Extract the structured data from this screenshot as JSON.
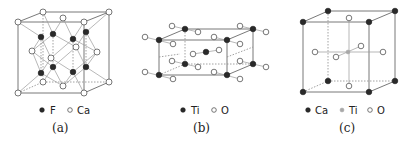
{
  "panels": [
    {
      "id": "a",
      "caption": "(a)",
      "structure": "fluorite",
      "legend": [
        {
          "symbol": "filled-circle",
          "label": "F"
        },
        {
          "symbol": "open-circle",
          "label": "Ca"
        }
      ]
    },
    {
      "id": "b",
      "caption": "(b)",
      "structure": "rutile",
      "legend": [
        {
          "symbol": "filled-circle",
          "label": "Ti"
        },
        {
          "symbol": "open-circle",
          "label": "O"
        }
      ]
    },
    {
      "id": "c",
      "caption": "(c)",
      "structure": "perovskite",
      "legend": [
        {
          "symbol": "filled-circle",
          "label": "Ca"
        },
        {
          "symbol": "gray-circle",
          "label": "Ti"
        },
        {
          "symbol": "open-circle",
          "label": "O"
        }
      ]
    }
  ],
  "colors": {
    "dark_atom": "#2a2a2a",
    "open_atom": "#ffffff",
    "gray_atom": "#a8a8a8",
    "edge": "#6a6a6a"
  }
}
